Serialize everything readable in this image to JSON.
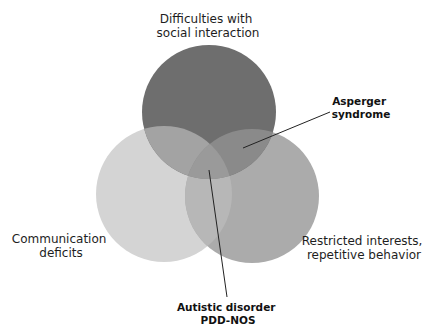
{
  "diagram": {
    "type": "venn",
    "circles": [
      {
        "id": "social",
        "label_lines": [
          "Difficulties with",
          "social interaction"
        ],
        "cx": 209,
        "cy": 112,
        "r": 67,
        "color": "#6e6e6e"
      },
      {
        "id": "communication",
        "label_lines": [
          "Communication",
          "deficits"
        ],
        "cx": 164,
        "cy": 194,
        "r": 68,
        "color": "#d4d4d4"
      },
      {
        "id": "restricted",
        "label_lines": [
          "Restricted interests,",
          "repetitive behavior"
        ],
        "cx": 252,
        "cy": 196,
        "r": 67,
        "color": "#ababab"
      }
    ],
    "overlap_colors": {
      "social_communication": "#a3a3a3",
      "social_restricted": "#8a8a8a",
      "communication_restricted": "#b7b7b7",
      "all_three": "#9a9a9a"
    },
    "labels": {
      "social": {
        "lines": [
          "Difficulties with",
          "social interaction"
        ],
        "x": 208,
        "y": [
          23,
          37
        ]
      },
      "communication": {
        "lines": [
          "Communication",
          "deficits"
        ],
        "x": 61,
        "y": [
          243,
          257
        ]
      },
      "restricted": {
        "lines": [
          "Restricted interests,",
          "repetitive behavior"
        ],
        "x": 364,
        "y": [
          245,
          259
        ]
      }
    },
    "callouts": [
      {
        "id": "asperger",
        "lines": [
          "Asperger",
          "syndrome"
        ],
        "text_x": 361,
        "text_y": [
          105,
          118
        ],
        "line": [
          243,
          148,
          330,
          112
        ]
      },
      {
        "id": "autistic",
        "lines": [
          "Autistic disorder",
          "PDD-NOS"
        ],
        "text_x": 228,
        "text_y": [
          311,
          324
        ],
        "line": [
          209,
          170,
          227,
          297
        ]
      }
    ]
  }
}
